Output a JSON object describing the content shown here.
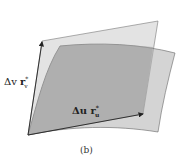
{
  "figure": {
    "caption": "(b)",
    "labels": {
      "v_vector": {
        "delta": "Δv",
        "vec": "r",
        "sub": "v",
        "sup": "*"
      },
      "u_vector": {
        "delta": "Δu",
        "vec": "r",
        "sub": "u",
        "sup": "*"
      }
    },
    "colors": {
      "tangent_plane": "#dcdcdc",
      "surface_patch": "#a9a9a9",
      "edge": "#555555",
      "arrow": "#222222"
    }
  }
}
